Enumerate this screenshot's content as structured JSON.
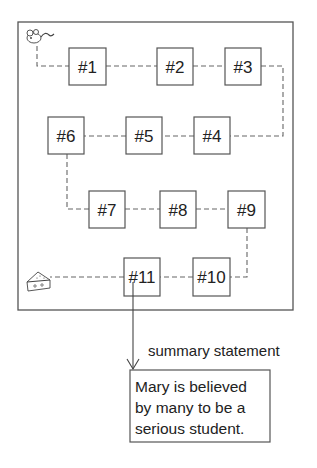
{
  "diagram": {
    "boxes": [
      {
        "id": "1",
        "label": "#1"
      },
      {
        "id": "2",
        "label": "#2"
      },
      {
        "id": "3",
        "label": "#3"
      },
      {
        "id": "4",
        "label": "#4"
      },
      {
        "id": "5",
        "label": "#5"
      },
      {
        "id": "6",
        "label": "#6"
      },
      {
        "id": "7",
        "label": "#7"
      },
      {
        "id": "8",
        "label": "#8"
      },
      {
        "id": "9",
        "label": "#9"
      },
      {
        "id": "10",
        "label": "#10"
      },
      {
        "id": "11",
        "label": "#11"
      }
    ],
    "start_icon": "mouse-icon",
    "end_icon": "cheese-icon",
    "caption": "summary statement",
    "summary": {
      "lines": [
        "Mary is believed",
        "by many to be a",
        "serious student."
      ]
    }
  }
}
